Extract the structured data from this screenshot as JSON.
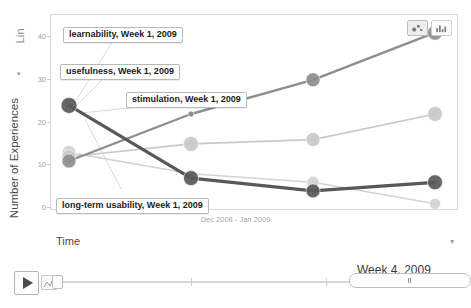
{
  "chart_data": {
    "type": "line",
    "title": "",
    "subtitle": "",
    "xlabel": "Dec 2008 - Jan 2009",
    "ylabel": "Number of Experiences",
    "ylim": [
      0,
      45
    ],
    "yticks": [
      0,
      10,
      20,
      30,
      40
    ],
    "ytick_labels": [
      "0",
      "10",
      "20",
      "30",
      "40"
    ],
    "grid": false,
    "legend_position": "annotations",
    "categories": [
      "Week 1, 2009",
      "Week 2, 2009",
      "Week 3, 2009",
      "Week 4, 2009"
    ],
    "series": [
      {
        "name": "learnability",
        "color": "#8e8e8e",
        "values": [
          11,
          22,
          30,
          41
        ],
        "bubble_sizes": [
          14,
          6,
          14,
          15
        ]
      },
      {
        "name": "usefulness",
        "color": "#c9c9c9",
        "values": [
          12,
          15,
          16,
          22
        ],
        "bubble_sizes": [
          14,
          15,
          14,
          15
        ]
      },
      {
        "name": "stimulation",
        "color": "#d3d3d3",
        "values": [
          13,
          8,
          6,
          1
        ],
        "bubble_sizes": [
          14,
          5,
          12,
          11
        ]
      },
      {
        "name": "long-term usability",
        "color": "#585858",
        "values": [
          24,
          7,
          4,
          6
        ],
        "bubble_sizes": [
          16,
          15,
          14,
          15
        ]
      }
    ],
    "annotations": [
      {
        "label": "learnability, Week 1, 2009"
      },
      {
        "label": "usefulness, Week 1, 2009"
      },
      {
        "label": "stimulation, Week 1, 2009"
      },
      {
        "label": "long-term usability, Week 1, 2009"
      }
    ]
  },
  "plot": {
    "series_legend_label": "Experience Type",
    "y_scale": "Lin",
    "y_scale_caret": "▾",
    "y_axis_title": "Number of Experiences",
    "x_axis_caption": "Dec 2008 - Jan 2009"
  },
  "chart_type_buttons": [
    {
      "name": "bubble-chart",
      "icon": "bubble-chart-icon",
      "active": true
    },
    {
      "name": "bar-chart",
      "icon": "bar-chart-icon",
      "active": false
    }
  ],
  "time_panel": {
    "label": "Time",
    "caret": "▾"
  },
  "playbar": {
    "play_label": "▶",
    "play_icon": "play-icon",
    "speed_icon": "speed-icon",
    "range_caption": "Week 4, 2009"
  },
  "colors": {
    "learnability": "#8e8e8e",
    "usefulness": "#c9c9c9",
    "stimulation": "#d3d3d3",
    "long_term_usability": "#585858",
    "frame_border": "#d6d6d6",
    "axis_text": "#9e9e9e"
  }
}
